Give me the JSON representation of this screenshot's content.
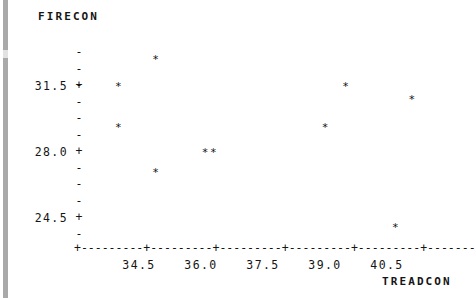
{
  "chart_data": {
    "type": "scatter",
    "title": "",
    "xlabel": "TREADCON",
    "ylabel": "FIRECON",
    "xticks": [
      34.5,
      36.0,
      37.5,
      39.0,
      40.5
    ],
    "xtick_labels": [
      "34.5",
      "36.0",
      "37.5",
      "39.0",
      "40.5"
    ],
    "yticks": [
      24.5,
      28.0,
      31.5
    ],
    "ytick_labels": [
      "24.5",
      "28.0",
      "31.5"
    ],
    "xlim": [
      33.6,
      42.2
    ],
    "ylim": [
      22.8,
      34.0
    ],
    "grid": false,
    "legend": null,
    "marker": "*",
    "x": [
      34.0,
      34.0,
      34.9,
      34.9,
      36.1,
      36.3,
      39.0,
      39.5,
      41.1,
      40.7
    ],
    "y": [
      31.5,
      29.3,
      32.9,
      26.9,
      28.0,
      28.0,
      29.3,
      31.5,
      30.8,
      24.0
    ],
    "points": [
      {
        "x": 34.0,
        "y": 31.5
      },
      {
        "x": 34.0,
        "y": 29.3
      },
      {
        "x": 34.9,
        "y": 32.9
      },
      {
        "x": 34.9,
        "y": 26.9
      },
      {
        "x": 36.1,
        "y": 28.0
      },
      {
        "x": 36.3,
        "y": 28.0
      },
      {
        "x": 39.0,
        "y": 29.3
      },
      {
        "x": 39.5,
        "y": 31.5
      },
      {
        "x": 41.1,
        "y": 30.8
      },
      {
        "x": 40.7,
        "y": 24.0
      }
    ],
    "n_points": 10
  },
  "axes": {
    "y_title": "FIRECON",
    "x_title": "TREADCON",
    "y_labels": [
      "31.5",
      "28.0",
      "24.5"
    ],
    "x_labels": [
      "34.5",
      "36.0",
      "37.5",
      "39.0",
      "40.5"
    ],
    "y_major_mark": "+",
    "y_minor_mark": "-",
    "x_axis_line": "+---------+---------+---------+---------+---------+-------"
  },
  "colors": {
    "ink": "#151515",
    "background": "#ffffff",
    "margin_bar": "#a9a9a9"
  }
}
